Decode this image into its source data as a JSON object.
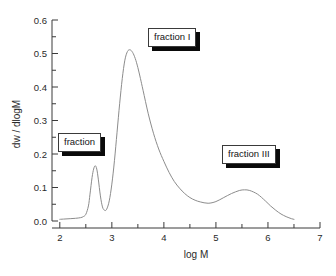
{
  "chart_data": {
    "type": "line",
    "title": "",
    "xlabel": "log M",
    "ylabel": "dw / dlogM",
    "xlim": [
      1.85,
      7.0
    ],
    "ylim": [
      0.0,
      0.6
    ],
    "grid": false,
    "legend": "none",
    "x_ticks": [
      "2",
      "3",
      "4",
      "5",
      "6",
      "7"
    ],
    "x_tick_values": [
      2,
      3,
      4,
      5,
      6,
      7
    ],
    "x_minor_tick_values": [
      2.5,
      3.5,
      4.5,
      5.5,
      6.5
    ],
    "y_ticks": [
      "0.0",
      "0.1",
      "0.2",
      "0.3",
      "0.4",
      "0.5",
      "0.6"
    ],
    "y_tick_values": [
      0.0,
      0.1,
      0.2,
      0.3,
      0.4,
      0.5,
      0.6
    ],
    "y_minor_tick_values": [
      0.05,
      0.15,
      0.25,
      0.35,
      0.45,
      0.55
    ],
    "series": [
      {
        "name": "molar mass distribution",
        "color": "#8c8c8c",
        "x": [
          2.0,
          2.1,
          2.2,
          2.3,
          2.4,
          2.45,
          2.5,
          2.55,
          2.58,
          2.62,
          2.65,
          2.68,
          2.71,
          2.74,
          2.78,
          2.82,
          2.86,
          2.9,
          2.95,
          3.0,
          3.05,
          3.1,
          3.15,
          3.2,
          3.25,
          3.3,
          3.35,
          3.4,
          3.45,
          3.5,
          3.55,
          3.6,
          3.7,
          3.8,
          3.9,
          4.0,
          4.1,
          4.2,
          4.3,
          4.4,
          4.5,
          4.6,
          4.7,
          4.85,
          5.0,
          5.15,
          5.3,
          5.45,
          5.55,
          5.65,
          5.8,
          5.95,
          6.05,
          6.15,
          6.25,
          6.35,
          6.45,
          6.5
        ],
        "y": [
          0.005,
          0.006,
          0.007,
          0.008,
          0.01,
          0.013,
          0.02,
          0.045,
          0.08,
          0.13,
          0.155,
          0.165,
          0.155,
          0.125,
          0.075,
          0.042,
          0.032,
          0.035,
          0.06,
          0.11,
          0.18,
          0.265,
          0.35,
          0.425,
          0.48,
          0.506,
          0.511,
          0.503,
          0.485,
          0.458,
          0.425,
          0.39,
          0.32,
          0.262,
          0.215,
          0.178,
          0.145,
          0.118,
          0.098,
          0.082,
          0.07,
          0.062,
          0.057,
          0.053,
          0.058,
          0.07,
          0.082,
          0.091,
          0.093,
          0.091,
          0.08,
          0.06,
          0.045,
          0.032,
          0.021,
          0.013,
          0.007,
          0.005
        ]
      }
    ],
    "annotations": [
      {
        "id": "fraction",
        "text": "fraction",
        "points_to_peak_x": 2.68,
        "peak_y": 0.165
      },
      {
        "id": "fraction_i",
        "text": "fraction I",
        "points_to_peak_x": 3.35,
        "peak_y": 0.511
      },
      {
        "id": "fraction_iii",
        "text": "fraction III",
        "points_to_peak_x": 5.55,
        "peak_y": 0.093
      }
    ]
  },
  "axes": {
    "x_title": "log M",
    "y_title": "dw / dlogM"
  }
}
